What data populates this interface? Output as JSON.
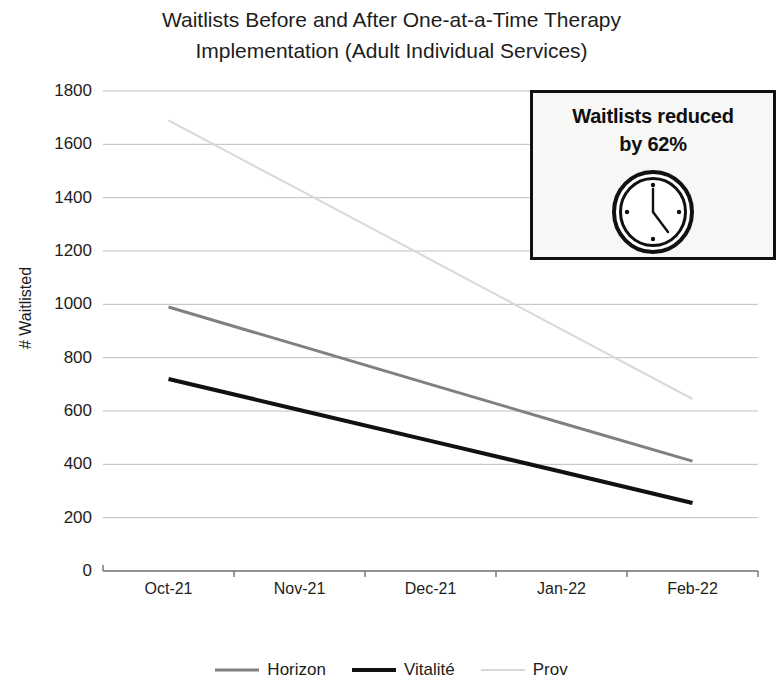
{
  "chart_data": {
    "type": "line",
    "title": "Waitlists Before and After One-at-a-Time Therapy Implementation (Adult Individual Services)",
    "title_lines": [
      "Waitlists Before and After One-at-a-Time Therapy",
      "Implementation (Adult Individual Services)"
    ],
    "xlabel": "",
    "ylabel": "# Waitlisted",
    "categories": [
      "Oct-21",
      "Nov-21",
      "Dec-21",
      "Jan-22",
      "Feb-22"
    ],
    "ylim": [
      0,
      1800
    ],
    "yticks": [
      1800,
      1600,
      1400,
      1200,
      1000,
      800,
      600,
      400,
      200,
      0
    ],
    "grid": true,
    "grid_axis": "y",
    "legend_position": "bottom",
    "series": [
      {
        "name": "Horizon",
        "values": [
          990,
          845,
          700,
          555,
          412
        ],
        "color": "#808080",
        "width": 3
      },
      {
        "name": "Vitalité",
        "values": [
          720,
          604,
          488,
          372,
          255
        ],
        "color": "#111111",
        "width": 4
      },
      {
        "name": "Prov",
        "values": [
          1690,
          1429,
          1168,
          906,
          645
        ],
        "color": "#d8d8d8",
        "width": 2
      }
    ],
    "annotations": [
      {
        "name": "waitlists-reduced-callout",
        "text": "Waitlists reduced by 62%",
        "text_lines": [
          "Waitlists reduced",
          "by 62%"
        ],
        "icon": "clock-icon",
        "border_color": "#111111",
        "background_color": "#f7f7f5"
      }
    ]
  },
  "colors": {
    "axis": "#6f6f6f",
    "grid": "#bfbfbf",
    "text": "#1d1d1d",
    "horizon": "#808080",
    "vitalite": "#111111",
    "prov": "#d8d8d8",
    "callout_border": "#111111",
    "callout_background": "#f7f7f5"
  }
}
